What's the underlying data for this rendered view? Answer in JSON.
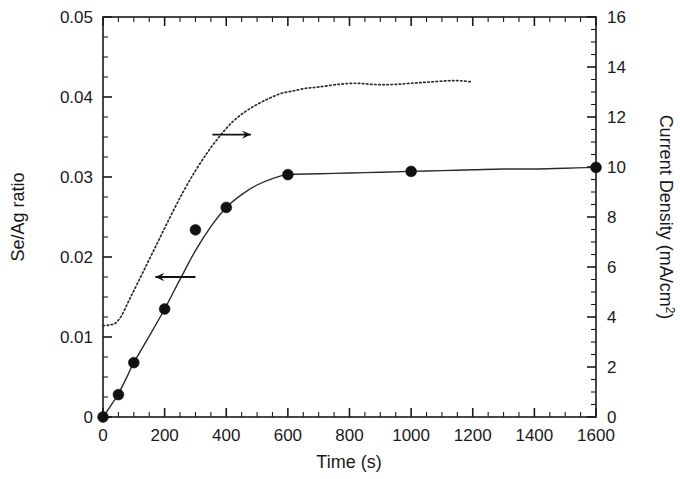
{
  "chart_data": {
    "type": "line",
    "title": "",
    "subtitle": "",
    "xlabel": "Time (s)",
    "ylabel": "Se/Ag ratio",
    "y2label": "Current Density (mA/cm",
    "y2label_sup": "2",
    "y2label_tail": ")",
    "xlim": [
      0,
      1600
    ],
    "ylim": [
      0,
      0.05
    ],
    "y2lim": [
      0,
      16
    ],
    "grid": false,
    "legend": "none",
    "x_ticks": [
      0,
      200,
      400,
      600,
      800,
      1000,
      1200,
      1400,
      1600
    ],
    "x_tick_labels": [
      "0",
      "200",
      "400",
      "600",
      "800",
      "1000",
      "1200",
      "1400",
      "1600"
    ],
    "x_minor_step": 50,
    "y_ticks": [
      0,
      0.01,
      0.02,
      0.03,
      0.04,
      0.05
    ],
    "y_tick_labels": [
      "0",
      "0.01",
      "0.02",
      "0.03",
      "0.04",
      "0.05"
    ],
    "y_minor_step": 0.0025,
    "y2_ticks": [
      0,
      2,
      4,
      6,
      8,
      10,
      12,
      14,
      16
    ],
    "y2_tick_labels": [
      "0",
      "2",
      "4",
      "6",
      "8",
      "10",
      "12",
      "14",
      "16"
    ],
    "y2_minor_step": 0.5,
    "series": [
      {
        "name": "Se/Ag ratio",
        "axis": "left",
        "style": "solid-with-markers",
        "marker": "filled-circle",
        "markers": [
          {
            "x": 0,
            "y": 0.0
          },
          {
            "x": 50,
            "y": 0.0028
          },
          {
            "x": 100,
            "y": 0.0068
          },
          {
            "x": 200,
            "y": 0.0135
          },
          {
            "x": 300,
            "y": 0.0234
          },
          {
            "x": 400,
            "y": 0.0262
          },
          {
            "x": 600,
            "y": 0.0303
          },
          {
            "x": 1000,
            "y": 0.0307
          },
          {
            "x": 1600,
            "y": 0.0312
          }
        ],
        "x": [
          0,
          25,
          50,
          75,
          100,
          150,
          200,
          250,
          300,
          350,
          400,
          450,
          500,
          550,
          600,
          700,
          800,
          900,
          1000,
          1100,
          1200,
          1300,
          1400,
          1500,
          1600
        ],
        "values": [
          0.0,
          0.0014,
          0.0029,
          0.0048,
          0.0068,
          0.0101,
          0.0135,
          0.0172,
          0.0208,
          0.0238,
          0.0262,
          0.0278,
          0.029,
          0.0298,
          0.0303,
          0.0304,
          0.0305,
          0.0306,
          0.0307,
          0.0308,
          0.0309,
          0.031,
          0.031,
          0.0311,
          0.0312
        ]
      },
      {
        "name": "Current Density",
        "axis": "right",
        "style": "dotted",
        "marker": "none",
        "x": [
          0,
          20,
          40,
          60,
          80,
          100,
          140,
          180,
          220,
          260,
          300,
          340,
          380,
          420,
          460,
          500,
          540,
          580,
          620,
          660,
          700,
          760,
          820,
          880,
          940,
          1000,
          1060,
          1120,
          1160,
          1200
        ],
        "values": [
          3.65,
          3.68,
          3.75,
          4.05,
          4.55,
          5.05,
          6.05,
          7.05,
          8.05,
          9.0,
          9.85,
          10.6,
          11.25,
          11.8,
          12.2,
          12.5,
          12.75,
          12.95,
          13.05,
          13.15,
          13.2,
          13.3,
          13.35,
          13.3,
          13.3,
          13.35,
          13.4,
          13.45,
          13.45,
          13.4
        ]
      }
    ],
    "annotations": [
      {
        "name": "left-axis-arrow",
        "symbol": "arrow-left",
        "x_start": 300,
        "y_value": 0.0175,
        "x_end": 170,
        "points_to": "Se/Ag ratio (left axis)"
      },
      {
        "name": "right-axis-arrow",
        "symbol": "arrow-right",
        "x_start": 355,
        "y_value": 0.0353,
        "x_end": 480,
        "points_to": "Current Density (right axis)"
      }
    ]
  }
}
